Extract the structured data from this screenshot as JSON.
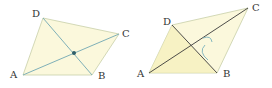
{
  "colors": {
    "fill": "#fbf8dc",
    "fill_shade": "#f5efb4",
    "diagonal_left": "#7fb0b8",
    "diagonal_right": "#3a3a3a",
    "edge": "#c8cfa8",
    "point": "#2f5f6a",
    "angle_mark": "#6aa8b8"
  },
  "figures": [
    {
      "name": "parallelogram-left",
      "vertices": {
        "A": {
          "label": "A",
          "x": 23,
          "y": 75
        },
        "B": {
          "label": "B",
          "x": 92,
          "y": 75
        },
        "C": {
          "label": "C",
          "x": 119,
          "y": 34
        },
        "D": {
          "label": "D",
          "x": 43,
          "y": 18
        }
      },
      "intersection": {
        "x": 74,
        "y": 53
      }
    },
    {
      "name": "parallelogram-right",
      "vertices": {
        "A": {
          "label": "A",
          "x": 149,
          "y": 73
        },
        "B": {
          "label": "B",
          "x": 217,
          "y": 73
        },
        "C": {
          "label": "C",
          "x": 248,
          "y": 8
        },
        "D": {
          "label": "D",
          "x": 172,
          "y": 25
        }
      }
    }
  ]
}
